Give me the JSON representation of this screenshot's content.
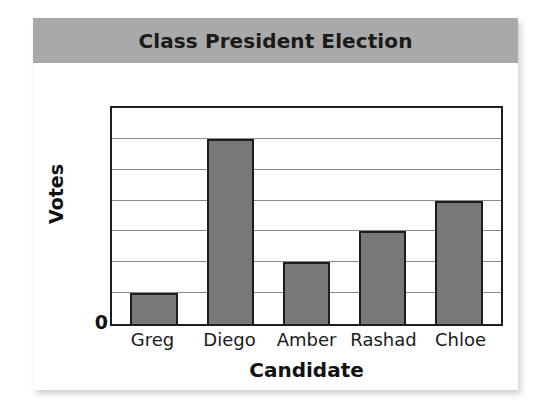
{
  "card": {
    "background": "#ffffff"
  },
  "banner": {
    "background": "#a9a9a9",
    "title": "Class President Election"
  },
  "chart_data": {
    "type": "bar",
    "title": "Class President Election",
    "xlabel": "Candidate",
    "ylabel": "Votes",
    "categories": [
      "Greg",
      "Diego",
      "Amber",
      "Rashad",
      "Chloe"
    ],
    "values": [
      1,
      6,
      2,
      3,
      4
    ],
    "ylim": [
      0,
      7
    ],
    "ytick_labels": [
      "0"
    ],
    "grid": true,
    "gridline_count": 7,
    "legend": null,
    "bar_color": "#787878",
    "bar_edge_color": "#1d1d1d",
    "plot_border_color": "#1d1d1d",
    "gridline_color": "#8b8b8b"
  }
}
